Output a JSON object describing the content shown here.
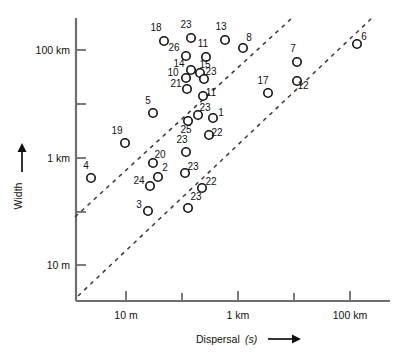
{
  "chart_data": {
    "type": "scatter",
    "title": "",
    "xlabel": "Dispersal (s)",
    "ylabel": "Width",
    "xlabel_main": "Dispersal",
    "xlabel_italic": "(s)",
    "grid": false,
    "legend": null,
    "x_scale": "log",
    "y_scale": "log",
    "x_tick_labels": [
      "10 m",
      "",
      "1 km",
      "",
      "100 km"
    ],
    "x_tick_labels_visible": [
      "10 m",
      "1 km",
      "100 km"
    ],
    "y_tick_labels": [
      "100 km",
      "",
      "1 km",
      "",
      "10 m"
    ],
    "y_tick_labels_visible": [
      "100 km",
      "1 km",
      "10 m"
    ],
    "x_ticks_px": [
      126,
      182,
      238,
      294,
      350
    ],
    "y_ticks_px": [
      50,
      104,
      158,
      212,
      265
    ],
    "xlim_px": [
      76,
      390
    ],
    "ylim_px": [
      18,
      300
    ],
    "point_count": 30,
    "points": [
      {
        "label": "18",
        "cx": 164,
        "cy": 41,
        "lx": 156,
        "ly": 31
      },
      {
        "label": "23",
        "cx": 191,
        "cy": 38,
        "lx": 186,
        "ly": 28
      },
      {
        "label": "13",
        "cx": 225,
        "cy": 40,
        "lx": 221,
        "ly": 30
      },
      {
        "label": "8",
        "cx": 243,
        "cy": 48,
        "lx": 249,
        "ly": 41
      },
      {
        "label": "26",
        "cx": 186,
        "cy": 56,
        "lx": 174,
        "ly": 51
      },
      {
        "label": "11",
        "cx": 206,
        "cy": 57,
        "lx": 203,
        "ly": 47
      },
      {
        "label": "14",
        "cx": 191,
        "cy": 70,
        "lx": 179,
        "ly": 67
      },
      {
        "label": "15",
        "cx": 200,
        "cy": 73,
        "lx": 205,
        "ly": 68
      },
      {
        "label": "10",
        "cx": 186,
        "cy": 78,
        "lx": 173,
        "ly": 76
      },
      {
        "label": "23",
        "cx": 204,
        "cy": 79,
        "lx": 211,
        "ly": 75
      },
      {
        "label": "21",
        "cx": 187,
        "cy": 89,
        "lx": 176,
        "ly": 87
      },
      {
        "label": "11",
        "cx": 203,
        "cy": 96,
        "lx": 211,
        "ly": 96
      },
      {
        "label": "7",
        "cx": 297,
        "cy": 62,
        "lx": 293,
        "ly": 52
      },
      {
        "label": "6",
        "cx": 357,
        "cy": 44,
        "lx": 364,
        "ly": 40
      },
      {
        "label": "12",
        "cx": 297,
        "cy": 81,
        "lx": 303,
        "ly": 89
      },
      {
        "label": "17",
        "cx": 268,
        "cy": 93,
        "lx": 263,
        "ly": 84
      },
      {
        "label": "5",
        "cx": 153,
        "cy": 113,
        "lx": 148,
        "ly": 104
      },
      {
        "label": "23",
        "cx": 198,
        "cy": 115,
        "lx": 205,
        "ly": 111
      },
      {
        "label": "25",
        "cx": 188,
        "cy": 121,
        "lx": 186,
        "ly": 133
      },
      {
        "label": "1",
        "cx": 213,
        "cy": 118,
        "lx": 221,
        "ly": 116
      },
      {
        "label": "22",
        "cx": 209,
        "cy": 135,
        "lx": 217,
        "ly": 136
      },
      {
        "label": "19",
        "cx": 125,
        "cy": 143,
        "lx": 117,
        "ly": 134
      },
      {
        "label": "23",
        "cx": 186,
        "cy": 152,
        "lx": 182,
        "ly": 143
      },
      {
        "label": "20",
        "cx": 153,
        "cy": 163,
        "lx": 160,
        "ly": 158
      },
      {
        "label": "4",
        "cx": 91,
        "cy": 178,
        "lx": 86,
        "ly": 169
      },
      {
        "label": "2",
        "cx": 158,
        "cy": 177,
        "lx": 165,
        "ly": 171
      },
      {
        "label": "23",
        "cx": 185,
        "cy": 173,
        "lx": 193,
        "ly": 170
      },
      {
        "label": "24",
        "cx": 150,
        "cy": 186,
        "lx": 139,
        "ly": 184
      },
      {
        "label": "22",
        "cx": 202,
        "cy": 188,
        "lx": 211,
        "ly": 185
      },
      {
        "label": "3",
        "cx": 148,
        "cy": 211,
        "lx": 139,
        "ly": 208
      },
      {
        "label": "23",
        "cx": 188,
        "cy": 208,
        "lx": 196,
        "ly": 200
      }
    ],
    "trend_lines": [
      {
        "name": "upper-bound-line",
        "x1": 75,
        "y1": 217,
        "x2": 292,
        "y2": 18,
        "style": "dashed"
      },
      {
        "name": "lower-bound-line",
        "x1": 78,
        "y1": 296,
        "x2": 372,
        "y2": 18,
        "style": "dashed"
      }
    ]
  }
}
